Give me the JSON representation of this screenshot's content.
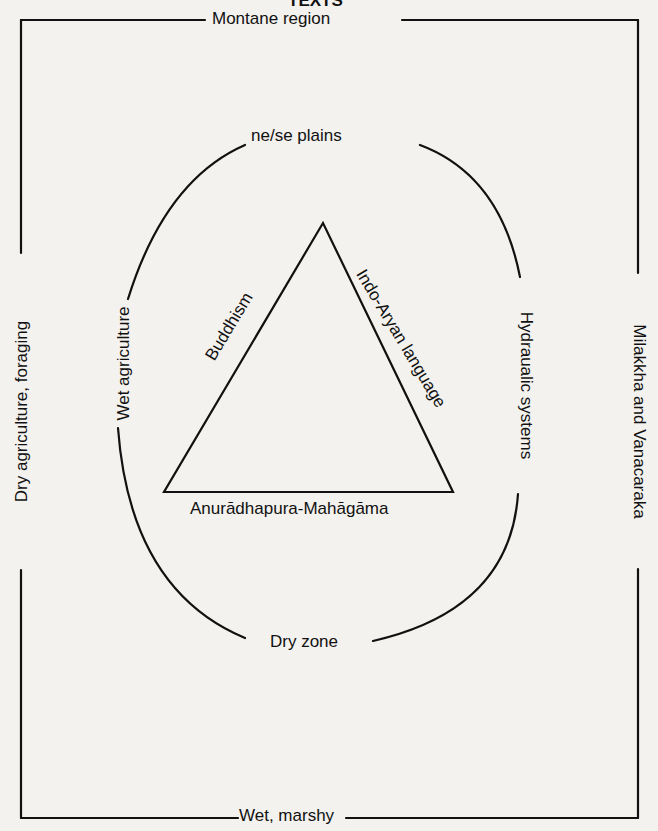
{
  "figure": {
    "title": "TEXTS",
    "outer_box": {
      "top_label": "Montane region",
      "bottom_label": "Wet, marshy",
      "left_label": "Dry agriculture, foraging",
      "right_label": "Milakkha and Vanacaraka"
    },
    "circle": {
      "top_label": "ne/se plains",
      "bottom_label": "Dry zone",
      "left_label": "Wet agriculture",
      "right_label": "Hydraualic systems"
    },
    "triangle": {
      "left_side_label": "Buddhism",
      "right_side_label": "Indo-Aryan language",
      "base_label": "Anurādhapura-Mahāgāma"
    },
    "colors": {
      "ink": "#111111",
      "paper": "#f4f2ee"
    }
  }
}
